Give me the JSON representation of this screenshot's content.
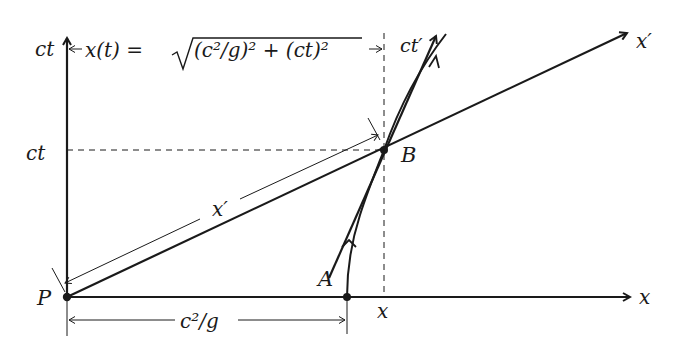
{
  "diagram": {
    "type": "spacetime-diagram",
    "axes": {
      "x_label": "x",
      "ct_label": "ct",
      "x_prime_label": "x′",
      "ct_prime_label": "ct′"
    },
    "points": {
      "P": "P",
      "A": "A",
      "B": "B"
    },
    "tick_labels": {
      "ct_tick": "ct",
      "x_tick": "x"
    },
    "annotations": {
      "top_formula_lhs": "x(t) = ",
      "top_formula_sqrt_body": "(c²/g)² + (ct)²",
      "x_prime_segment": "x′",
      "bottom_dimension": "c²/g"
    },
    "colors": {
      "ink": "#1a1a1a",
      "background": "#ffffff"
    }
  }
}
